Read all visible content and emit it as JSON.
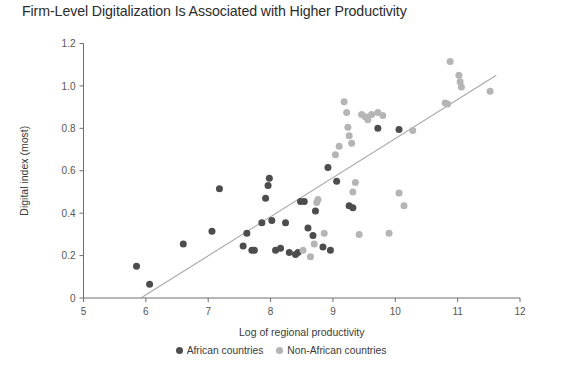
{
  "chart_data": {
    "type": "scatter",
    "title": "Firm-Level Digitalization Is Associated with Higher Productivity",
    "xlabel": "Log of regional productivity",
    "ylabel": "Digital index (most)",
    "xlim": [
      5,
      12
    ],
    "ylim": [
      0,
      1.2
    ],
    "xticks": [
      "5",
      "6",
      "7",
      "8",
      "9",
      "10",
      "11",
      "12"
    ],
    "xtick_values": [
      5,
      6,
      7,
      8,
      9,
      10,
      11,
      12
    ],
    "yticks": [
      "0",
      "0.2",
      "0.4",
      "0.6",
      "0.8",
      "1.0",
      "1.2"
    ],
    "ytick_values": [
      0,
      0.2,
      0.4,
      0.6,
      0.8,
      1.0,
      1.2
    ],
    "grid": false,
    "legend_position": "bottom-center",
    "colors": {
      "african": "#4d4d4d",
      "non_african": "#b5b5b5",
      "trendline": "#a8a8a8",
      "axis": "#6e6e6e",
      "title": "#2b2b2b"
    },
    "trendline": {
      "label": "linear fit",
      "x": [
        5.92,
        11.62
      ],
      "y": [
        0.0,
        1.05
      ]
    },
    "series": [
      {
        "name": "African countries",
        "color": "#4d4d4d",
        "points": [
          [
            5.85,
            0.15
          ],
          [
            6.06,
            0.065
          ],
          [
            6.6,
            0.255
          ],
          [
            7.06,
            0.315
          ],
          [
            7.18,
            0.515
          ],
          [
            7.56,
            0.245
          ],
          [
            7.62,
            0.305
          ],
          [
            7.7,
            0.225
          ],
          [
            7.74,
            0.225
          ],
          [
            7.86,
            0.355
          ],
          [
            7.92,
            0.47
          ],
          [
            7.96,
            0.53
          ],
          [
            7.98,
            0.565
          ],
          [
            8.02,
            0.365
          ],
          [
            8.08,
            0.225
          ],
          [
            8.16,
            0.235
          ],
          [
            8.24,
            0.355
          ],
          [
            8.3,
            0.215
          ],
          [
            8.4,
            0.205
          ],
          [
            8.44,
            0.215
          ],
          [
            8.48,
            0.455
          ],
          [
            8.54,
            0.455
          ],
          [
            8.6,
            0.33
          ],
          [
            8.68,
            0.295
          ],
          [
            8.72,
            0.41
          ],
          [
            8.84,
            0.24
          ],
          [
            8.92,
            0.615
          ],
          [
            8.96,
            0.225
          ],
          [
            9.06,
            0.55
          ],
          [
            9.26,
            0.435
          ],
          [
            9.32,
            0.425
          ],
          [
            9.72,
            0.8
          ],
          [
            10.06,
            0.795
          ]
        ]
      },
      {
        "name": "Non-African countries",
        "color": "#b5b5b5",
        "points": [
          [
            8.52,
            0.225
          ],
          [
            8.64,
            0.195
          ],
          [
            8.7,
            0.255
          ],
          [
            8.74,
            0.45
          ],
          [
            8.76,
            0.465
          ],
          [
            8.86,
            0.305
          ],
          [
            9.04,
            0.675
          ],
          [
            9.1,
            0.715
          ],
          [
            9.18,
            0.925
          ],
          [
            9.22,
            0.875
          ],
          [
            9.24,
            0.805
          ],
          [
            9.26,
            0.765
          ],
          [
            9.3,
            0.73
          ],
          [
            9.32,
            0.5
          ],
          [
            9.36,
            0.545
          ],
          [
            9.42,
            0.3
          ],
          [
            9.46,
            0.865
          ],
          [
            9.52,
            0.855
          ],
          [
            9.56,
            0.84
          ],
          [
            9.62,
            0.865
          ],
          [
            9.72,
            0.875
          ],
          [
            9.8,
            0.86
          ],
          [
            9.9,
            0.305
          ],
          [
            10.06,
            0.495
          ],
          [
            10.14,
            0.435
          ],
          [
            10.28,
            0.79
          ],
          [
            10.8,
            0.92
          ],
          [
            10.84,
            0.915
          ],
          [
            10.88,
            1.115
          ],
          [
            11.02,
            1.05
          ],
          [
            11.04,
            1.02
          ],
          [
            11.06,
            0.995
          ],
          [
            11.52,
            0.975
          ]
        ]
      }
    ]
  },
  "legend": [
    {
      "label": "African countries",
      "color": "#4d4d4d",
      "dot": "series-dot"
    },
    {
      "label": "Non-African countries",
      "color": "#b5b5b5",
      "dot": "series-dot"
    }
  ]
}
